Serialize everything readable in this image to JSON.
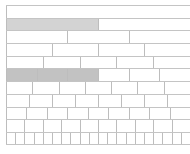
{
  "fraction_wall": {
    "total_width_px": 184,
    "rows": [
      {
        "denominator": 1,
        "shaded": 0
      },
      {
        "denominator": 2,
        "shaded": 1
      },
      {
        "denominator": 3,
        "shaded": 0
      },
      {
        "denominator": 4,
        "shaded": 0
      },
      {
        "denominator": 5,
        "shaded": 0
      },
      {
        "denominator": 6,
        "shaded": 3
      },
      {
        "denominator": 7,
        "shaded": 0
      },
      {
        "denominator": 8,
        "shaded": 0
      },
      {
        "denominator": 9,
        "shaded": 0
      },
      {
        "denominator": 10,
        "shaded": 0
      },
      {
        "denominator": 20,
        "shaded": 0
      }
    ],
    "colors": {
      "line": "#c4c4c4",
      "shade_half": "#d3d3d3",
      "shade_sixths": "#c2c2c2",
      "background": "#ffffff"
    }
  }
}
